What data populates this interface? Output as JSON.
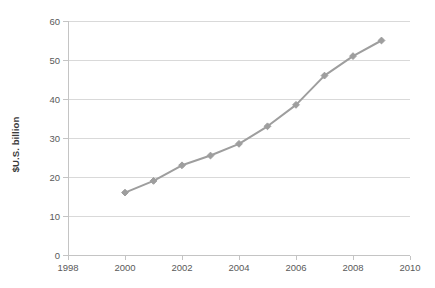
{
  "chart_data": {
    "type": "line",
    "title": "",
    "subtitle": "",
    "xlabel": "",
    "ylabel": "$U.S. billion",
    "xlim": [
      1998,
      2010
    ],
    "ylim": [
      0,
      60
    ],
    "x_tick_labels": [
      "1998",
      "2000",
      "2002",
      "2004",
      "2006",
      "2008",
      "2010"
    ],
    "x_ticks": [
      1998,
      2000,
      2002,
      2004,
      2006,
      2008,
      2010
    ],
    "y_tick_labels": [
      "0",
      "10",
      "20",
      "30",
      "40",
      "50",
      "60"
    ],
    "y_ticks": [
      0,
      10,
      20,
      30,
      40,
      50,
      60
    ],
    "grid": "horizontal",
    "legend": "none",
    "marker": "diamond",
    "series_color": "#9e9e9e",
    "gridline_color": "#d9d9d9",
    "axis_color": "#c4c4c4",
    "background": "#ffffff",
    "x": [
      2000,
      2001,
      2002,
      2003,
      2004,
      2005,
      2006,
      2007,
      2008,
      2009
    ],
    "values": [
      16,
      19,
      23,
      25.5,
      28.5,
      33,
      38.5,
      46,
      51,
      55
    ],
    "series": [
      {
        "name": "$U.S. billion",
        "values": [
          16,
          19,
          23,
          25.5,
          28.5,
          33,
          38.5,
          46,
          51,
          55
        ]
      }
    ],
    "annotations": []
  }
}
